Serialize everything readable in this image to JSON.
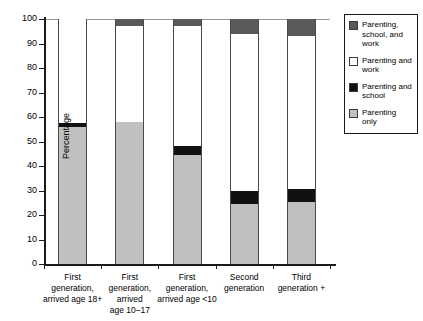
{
  "chart_data": {
    "type": "bar",
    "stacked": true,
    "title": "",
    "xlabel": "",
    "ylabel": "Percentage",
    "ylim": [
      0,
      100
    ],
    "yticks": [
      0,
      10,
      20,
      30,
      40,
      50,
      60,
      70,
      80,
      90,
      100
    ],
    "grid": false,
    "legend_position": "right",
    "categories": [
      "First generation, arrived age 18+",
      "First generation, arrived age 10–17",
      "First generation, arrived age <10",
      "Second generation",
      "Third generation +"
    ],
    "category_lines": [
      [
        "First",
        "generation,",
        "arrived age 18+"
      ],
      [
        "First",
        "generation,",
        "arrived",
        "age 10–17"
      ],
      [
        "First",
        "generation,",
        "arrived age <10"
      ],
      [
        "Second",
        "generation"
      ],
      [
        "Third",
        "generation +"
      ]
    ],
    "series": [
      {
        "name": "Parenting only",
        "key": "parenting-only",
        "color": "#c0c0c0",
        "values": [
          56,
          58,
          44.5,
          24.5,
          25.5
        ]
      },
      {
        "name": "Parenting and school",
        "key": "parenting-and-school",
        "color": "#111111",
        "values": [
          1.5,
          0,
          3.5,
          5.5,
          5
        ]
      },
      {
        "name": "Parenting and work",
        "key": "parenting-and-work",
        "color": "#ffffff",
        "values": [
          42.5,
          39,
          49,
          64,
          62.5
        ]
      },
      {
        "name": "Parenting, school, and work",
        "key": "parenting-school-and-work",
        "color": "#5a5a5a",
        "values": [
          0,
          3,
          3,
          6,
          7
        ]
      }
    ]
  },
  "legend": {
    "items": [
      {
        "label": "Parenting, school, and work",
        "key": "parenting-school-and-work"
      },
      {
        "label": "Parenting and work",
        "key": "parenting-and-work"
      },
      {
        "label": "Parenting and school",
        "key": "parenting-and-school"
      },
      {
        "label": "Parenting only",
        "key": "parenting-only"
      }
    ]
  },
  "colors": {
    "parenting_only": "#c0c0c0",
    "parenting_and_school": "#111111",
    "parenting_and_work": "#ffffff",
    "parenting_school_and_work": "#5a5a5a",
    "axis": "#1a1a1a"
  }
}
